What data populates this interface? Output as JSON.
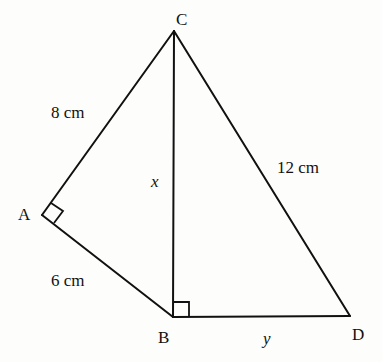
{
  "diagram": {
    "type": "geometry-figure",
    "vertices": {
      "A": {
        "label": "A",
        "x": 42,
        "y": 215
      },
      "B": {
        "label": "B",
        "x": 173,
        "y": 317
      },
      "C": {
        "label": "C",
        "x": 174,
        "y": 31
      },
      "D": {
        "label": "D",
        "x": 350,
        "y": 316
      }
    },
    "segments": [
      {
        "from": "A",
        "to": "C",
        "label": "8 cm"
      },
      {
        "from": "A",
        "to": "B",
        "label": "6 cm"
      },
      {
        "from": "C",
        "to": "B",
        "label": "x"
      },
      {
        "from": "C",
        "to": "D",
        "label": "12 cm"
      },
      {
        "from": "B",
        "to": "D",
        "label": "y"
      }
    ],
    "right_angles": [
      "A",
      "B"
    ],
    "labels": {
      "vertex_a": "A",
      "vertex_b": "B",
      "vertex_c": "C",
      "vertex_d": "D",
      "side_ac": "8 cm",
      "side_ab": "6 cm",
      "side_cb": "x",
      "side_cd": "12 cm",
      "side_bd": "y"
    },
    "colors": {
      "stroke": "#111111",
      "background": "#fdfdfb"
    }
  }
}
